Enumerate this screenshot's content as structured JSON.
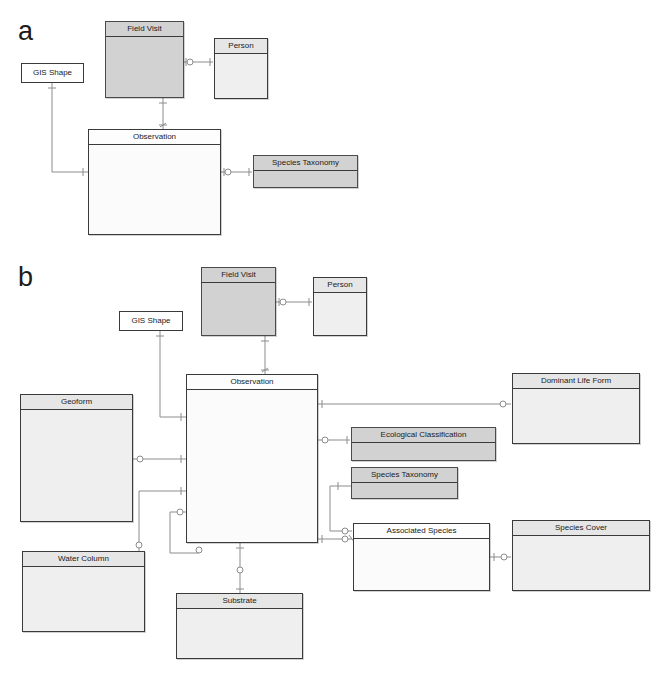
{
  "figure": {
    "panels": [
      {
        "id": "a",
        "label": "a"
      },
      {
        "id": "b",
        "label": "b"
      }
    ]
  },
  "panel_a": {
    "label": "a",
    "entities": [
      {
        "key": "gis_shape",
        "name": "GIS Shape",
        "style": "simple",
        "x": 21,
        "y": 63,
        "w": 63,
        "h": 20
      },
      {
        "key": "field_visit",
        "name": "Field Visit",
        "style": "shaded",
        "x": 105,
        "y": 21,
        "w": 79,
        "h": 77
      },
      {
        "key": "person",
        "name": "Person",
        "style": "light",
        "x": 214,
        "y": 38,
        "w": 54,
        "h": 61
      },
      {
        "key": "observation",
        "name": "Observation",
        "style": "plain",
        "x": 88,
        "y": 129,
        "w": 133,
        "h": 106
      },
      {
        "key": "species_taxonomy",
        "name": "Species Taxonomy",
        "style": "shaded",
        "x": 253,
        "y": 155,
        "w": 105,
        "h": 33
      }
    ],
    "relationships": [
      {
        "from": "field_visit",
        "to": "person",
        "kind": "one-to-many"
      },
      {
        "from": "field_visit",
        "to": "observation",
        "kind": "one-to-many"
      },
      {
        "from": "gis_shape",
        "to": "observation",
        "kind": "one-to-many"
      },
      {
        "from": "observation",
        "to": "species_taxonomy",
        "kind": "one-to-many"
      }
    ]
  },
  "panel_b": {
    "label": "b",
    "entities": [
      {
        "key": "gis_shape",
        "name": "GIS Shape",
        "style": "simple",
        "x": 119,
        "y": 311,
        "w": 64,
        "h": 20
      },
      {
        "key": "field_visit",
        "name": "Field Visit",
        "style": "shaded",
        "x": 201,
        "y": 267,
        "w": 75,
        "h": 69
      },
      {
        "key": "person",
        "name": "Person",
        "style": "light",
        "x": 313,
        "y": 277,
        "w": 54,
        "h": 59
      },
      {
        "key": "observation",
        "name": "Observation",
        "style": "plain",
        "x": 186,
        "y": 374,
        "w": 132,
        "h": 169
      },
      {
        "key": "geoform",
        "name": "Geoform",
        "style": "light",
        "x": 20,
        "y": 394,
        "w": 113,
        "h": 128
      },
      {
        "key": "water_column",
        "name": "Water Column",
        "style": "light",
        "x": 22,
        "y": 551,
        "w": 123,
        "h": 81
      },
      {
        "key": "substrate",
        "name": "Substrate",
        "style": "light",
        "x": 176,
        "y": 593,
        "w": 127,
        "h": 66
      },
      {
        "key": "dominant_life",
        "name": "Dominant Life Form",
        "style": "light",
        "x": 512,
        "y": 373,
        "w": 128,
        "h": 71
      },
      {
        "key": "eco_class",
        "name": "Ecological Classification",
        "style": "shaded",
        "x": 351,
        "y": 427,
        "w": 145,
        "h": 34
      },
      {
        "key": "species_taxonomy",
        "name": "Species Taxonomy",
        "style": "shaded",
        "x": 351,
        "y": 467,
        "w": 107,
        "h": 32
      },
      {
        "key": "assoc_species",
        "name": "Associated Species",
        "style": "plain",
        "x": 353,
        "y": 523,
        "w": 137,
        "h": 68
      },
      {
        "key": "species_cover",
        "name": "Species Cover",
        "style": "light",
        "x": 512,
        "y": 520,
        "w": 138,
        "h": 71
      }
    ],
    "relationships": [
      {
        "from": "field_visit",
        "to": "person",
        "kind": "one-to-many"
      },
      {
        "from": "field_visit",
        "to": "observation",
        "kind": "one-to-many"
      },
      {
        "from": "gis_shape",
        "to": "observation",
        "kind": "one-to-many"
      },
      {
        "from": "geoform",
        "to": "observation",
        "kind": "one-to-many"
      },
      {
        "from": "water_column",
        "to": "observation",
        "kind": "one-to-many"
      },
      {
        "from": "observation",
        "to": "substrate",
        "kind": "one-to-many"
      },
      {
        "from": "observation",
        "to": "dominant_life",
        "kind": "one-to-many"
      },
      {
        "from": "observation",
        "to": "eco_class",
        "kind": "one-to-many"
      },
      {
        "from": "observation",
        "to": "assoc_species",
        "kind": "one-to-many"
      },
      {
        "from": "species_taxonomy",
        "to": "assoc_species",
        "kind": "one-to-many"
      },
      {
        "from": "assoc_species",
        "to": "species_cover",
        "kind": "one-to-many"
      }
    ]
  },
  "colors": {
    "background": "#ffffff",
    "shaded_fill": "#d2d2d2",
    "light_fill": "#efefef",
    "plain_fill": "#fbfbfb",
    "border": "#3a3a3a",
    "connector": "#8c8c8c",
    "text": "#1a1a1a"
  }
}
